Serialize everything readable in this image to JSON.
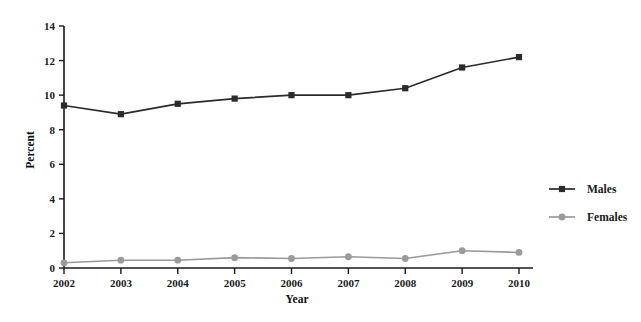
{
  "chart_data": {
    "type": "line",
    "title": "",
    "xlabel": "Year",
    "ylabel": "Percent",
    "categories": [
      "2002",
      "2003",
      "2004",
      "2005",
      "2006",
      "2007",
      "2008",
      "2009",
      "2010"
    ],
    "x": [
      2002,
      2003,
      2004,
      2005,
      2006,
      2007,
      2008,
      2009,
      2010
    ],
    "xlim": [
      2002,
      2010
    ],
    "ylim": [
      0,
      14
    ],
    "yticks": [
      0,
      2,
      4,
      6,
      8,
      10,
      12,
      14
    ],
    "ytick_labels": [
      "0",
      "2",
      "4",
      "6",
      "8",
      "10",
      "12",
      "14"
    ],
    "grid": false,
    "legend_position": "right",
    "series": [
      {
        "name": "Males",
        "color": "#2b2b2b",
        "marker": "square",
        "values": [
          9.4,
          8.9,
          9.5,
          9.8,
          10.0,
          10.0,
          10.4,
          11.6,
          12.2
        ]
      },
      {
        "name": "Females",
        "color": "#9a9a9a",
        "marker": "circle",
        "values": [
          0.3,
          0.45,
          0.45,
          0.6,
          0.55,
          0.65,
          0.55,
          1.0,
          0.9
        ]
      }
    ]
  },
  "legend": {
    "items": [
      {
        "label": "Males"
      },
      {
        "label": "Females"
      }
    ]
  },
  "colors": {
    "males": "#2b2b2b",
    "females": "#9a9a9a",
    "axis": "#1a1a1a",
    "background": "#ffffff"
  }
}
